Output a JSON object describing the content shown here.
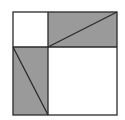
{
  "diagram": {
    "title": "",
    "colors": {
      "background": "#ffffff",
      "shade": "#9a9a9a",
      "stroke": "#2a2a2a"
    },
    "outer_square": {
      "x": 13,
      "y": 12,
      "size": 104
    },
    "split": {
      "x": 48,
      "y": 47
    }
  }
}
